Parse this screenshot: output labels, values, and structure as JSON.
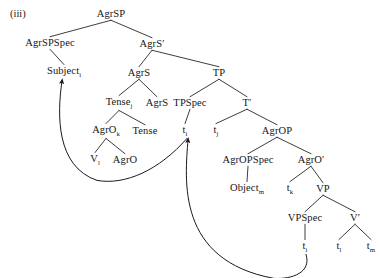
{
  "figure": {
    "example_label": "(iii)",
    "caption": "",
    "type": "syntax-tree",
    "framework": "X-bar / Agreement-Phrase structure",
    "colors": {
      "text": "#161616",
      "line": "#1a1a1a",
      "background": "#ffffff"
    }
  },
  "nodes": [
    {
      "id": "agrsp",
      "label": "AgrSP",
      "sub": "",
      "prime": false,
      "x": 111,
      "y": 14,
      "kind": "phrase"
    },
    {
      "id": "agrspspec",
      "label": "AgrSPSpec",
      "sub": "",
      "prime": false,
      "x": 50,
      "y": 43,
      "kind": "specifier"
    },
    {
      "id": "agrsbar",
      "label": "AgrS",
      "sub": "",
      "prime": true,
      "x": 152,
      "y": 44,
      "kind": "bar"
    },
    {
      "id": "subject",
      "label": "Subject",
      "sub": "i",
      "prime": false,
      "x": 64,
      "y": 72,
      "kind": "terminal"
    },
    {
      "id": "agrs",
      "label": "AgrS",
      "sub": "",
      "prime": false,
      "x": 139,
      "y": 73,
      "kind": "head"
    },
    {
      "id": "tp",
      "label": "TP",
      "sub": "",
      "prime": false,
      "x": 219,
      "y": 73,
      "kind": "phrase"
    },
    {
      "id": "tense-j",
      "label": "Tense",
      "sub": "j",
      "prime": false,
      "x": 119,
      "y": 103,
      "kind": "head"
    },
    {
      "id": "agrs2",
      "label": "AgrS",
      "sub": "",
      "prime": false,
      "x": 157,
      "y": 103,
      "kind": "head"
    },
    {
      "id": "tpspec",
      "label": "TPSpec",
      "sub": "",
      "prime": false,
      "x": 190,
      "y": 103,
      "kind": "specifier"
    },
    {
      "id": "tbar",
      "label": "T",
      "sub": "",
      "prime": true,
      "x": 247,
      "y": 103,
      "kind": "bar"
    },
    {
      "id": "agro-k",
      "label": "AgrO",
      "sub": "k",
      "prime": false,
      "x": 106,
      "y": 131,
      "kind": "head"
    },
    {
      "id": "tense",
      "label": "Tense",
      "sub": "",
      "prime": false,
      "x": 145,
      "y": 131,
      "kind": "head"
    },
    {
      "id": "t-i-tp",
      "label": "t",
      "sub": "i",
      "prime": false,
      "x": 185,
      "y": 131,
      "kind": "trace"
    },
    {
      "id": "t-j",
      "label": "t",
      "sub": "j",
      "prime": false,
      "x": 216,
      "y": 131,
      "kind": "trace"
    },
    {
      "id": "agrop",
      "label": "AgrOP",
      "sub": "",
      "prime": false,
      "x": 277,
      "y": 131,
      "kind": "phrase"
    },
    {
      "id": "v-l",
      "label": "V",
      "sub": "l",
      "prime": false,
      "x": 95,
      "y": 160,
      "kind": "terminal"
    },
    {
      "id": "agro",
      "label": "AgrO",
      "sub": "",
      "prime": false,
      "x": 125,
      "y": 160,
      "kind": "head"
    },
    {
      "id": "agropspec",
      "label": "AgrOPSpec",
      "sub": "",
      "prime": false,
      "x": 248,
      "y": 160,
      "kind": "specifier"
    },
    {
      "id": "agrobar",
      "label": "AgrO",
      "sub": "",
      "prime": true,
      "x": 311,
      "y": 160,
      "kind": "bar"
    },
    {
      "id": "object-m",
      "label": "Object",
      "sub": "m",
      "prime": false,
      "x": 247,
      "y": 189,
      "kind": "terminal"
    },
    {
      "id": "t-k",
      "label": "t",
      "sub": "k",
      "prime": false,
      "x": 290,
      "y": 189,
      "kind": "trace"
    },
    {
      "id": "vp",
      "label": "VP",
      "sub": "",
      "prime": false,
      "x": 323,
      "y": 189,
      "kind": "phrase"
    },
    {
      "id": "vpspec",
      "label": "VPSpec",
      "sub": "",
      "prime": false,
      "x": 305,
      "y": 218,
      "kind": "specifier"
    },
    {
      "id": "vbar",
      "label": "V",
      "sub": "",
      "prime": true,
      "x": 355,
      "y": 218,
      "kind": "bar"
    },
    {
      "id": "t-i-vp",
      "label": "t",
      "sub": "i",
      "prime": false,
      "x": 305,
      "y": 247,
      "kind": "trace"
    },
    {
      "id": "t-l",
      "label": "t",
      "sub": "l",
      "prime": false,
      "x": 339,
      "y": 247,
      "kind": "trace"
    },
    {
      "id": "t-m",
      "label": "t",
      "sub": "m",
      "prime": false,
      "x": 371,
      "y": 247,
      "kind": "trace"
    }
  ],
  "branches": [
    {
      "from": "agrsp",
      "to": "agrspspec"
    },
    {
      "from": "agrsp",
      "to": "agrsbar"
    },
    {
      "from": "agrspspec",
      "to": "subject"
    },
    {
      "from": "agrsbar",
      "to": "agrs"
    },
    {
      "from": "agrsbar",
      "to": "tp"
    },
    {
      "from": "agrs",
      "to": "tense-j"
    },
    {
      "from": "agrs",
      "to": "agrs2"
    },
    {
      "from": "tp",
      "to": "tpspec"
    },
    {
      "from": "tp",
      "to": "tbar"
    },
    {
      "from": "tense-j",
      "to": "agro-k"
    },
    {
      "from": "tense-j",
      "to": "tense"
    },
    {
      "from": "tpspec",
      "to": "t-i-tp"
    },
    {
      "from": "tbar",
      "to": "t-j"
    },
    {
      "from": "tbar",
      "to": "agrop"
    },
    {
      "from": "agro-k",
      "to": "v-l"
    },
    {
      "from": "agro-k",
      "to": "agro"
    },
    {
      "from": "agrop",
      "to": "agropspec"
    },
    {
      "from": "agrop",
      "to": "agrobar"
    },
    {
      "from": "agropspec",
      "to": "object-m"
    },
    {
      "from": "agrobar",
      "to": "t-k"
    },
    {
      "from": "agrobar",
      "to": "vp"
    },
    {
      "from": "vp",
      "to": "vpspec"
    },
    {
      "from": "vp",
      "to": "vbar"
    },
    {
      "from": "vpspec",
      "to": "t-i-vp"
    },
    {
      "from": "vbar",
      "to": "t-l"
    },
    {
      "from": "vbar",
      "to": "t-m"
    }
  ],
  "movement_arrows": [
    {
      "id": "arrow-t-to-subject",
      "from": "t-i-tp",
      "to": "subject",
      "description": "subject raising from TPSpec trace to AgrSPSpec"
    },
    {
      "id": "arrow-vpspec-to-t",
      "from": "t-i-vp",
      "to": "t-i-tp",
      "description": "subject raising from VPSpec trace to TPSpec trace"
    }
  ]
}
